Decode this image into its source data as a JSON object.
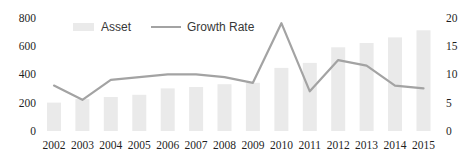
{
  "chart_data": {
    "type": "bar+line",
    "title": "",
    "categories": [
      "2002",
      "2003",
      "2004",
      "2005",
      "2006",
      "2007",
      "2008",
      "2009",
      "2010",
      "2011",
      "2012",
      "2013",
      "2014",
      "2015"
    ],
    "series": [
      {
        "name": "Asset",
        "type": "bar",
        "axis": "left",
        "values": [
          200,
          225,
          240,
          255,
          300,
          310,
          330,
          340,
          445,
          480,
          590,
          620,
          660,
          710
        ]
      },
      {
        "name": "Growth Rate",
        "type": "line",
        "axis": "right",
        "values": [
          8,
          5.5,
          9,
          9.5,
          10,
          10,
          9.5,
          8.5,
          19,
          7,
          12.5,
          11.5,
          8,
          7.5
        ]
      }
    ],
    "axes": {
      "left": {
        "min": 0,
        "max": 800,
        "ticks": [
          0,
          200,
          400,
          600,
          800
        ]
      },
      "right": {
        "min": 0,
        "max": 20,
        "ticks": [
          0,
          5,
          10,
          15,
          20
        ]
      }
    },
    "legend": {
      "position": "top-center",
      "items": [
        "Asset",
        "Growth Rate"
      ]
    },
    "grid": false,
    "colors": {
      "bar": "#eaeaea",
      "line": "#a3a3a3",
      "text": "#1f1f1f"
    }
  }
}
